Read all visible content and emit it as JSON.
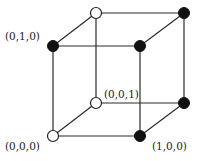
{
  "diagram": {
    "nodes": [
      {
        "id": "front-bottom-left",
        "x": 53,
        "y": 136,
        "style": "open",
        "label": "(0,0,0)"
      },
      {
        "id": "front-bottom-right",
        "x": 140,
        "y": 136,
        "style": "filled",
        "label": "(1,0,0)"
      },
      {
        "id": "front-top-left",
        "x": 53,
        "y": 46,
        "style": "filled",
        "label": "(0,1,0)"
      },
      {
        "id": "front-top-right",
        "x": 140,
        "y": 46,
        "style": "filled",
        "label": ""
      },
      {
        "id": "back-bottom-left",
        "x": 96,
        "y": 103,
        "style": "open",
        "label": "(0,0,1)"
      },
      {
        "id": "back-bottom-right",
        "x": 184,
        "y": 103,
        "style": "filled",
        "label": ""
      },
      {
        "id": "back-top-left",
        "x": 96,
        "y": 13,
        "style": "open",
        "label": ""
      },
      {
        "id": "back-top-right",
        "x": 184,
        "y": 13,
        "style": "filled",
        "label": ""
      }
    ],
    "labels": {
      "origin": "(0,0,0)",
      "x_unit": "(1,0,0)",
      "y_unit": "(0,1,0)",
      "z_unit": "(0,0,1)"
    },
    "colors": {
      "filled": "#111111",
      "open": "#ffffff",
      "edge": "#2a2a2a"
    }
  }
}
